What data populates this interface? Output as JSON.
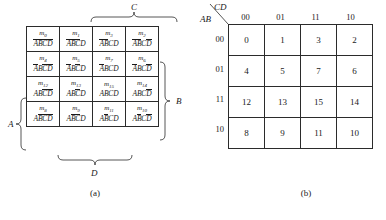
{
  "figure": {
    "caption_a": "(a)",
    "caption_b": "(b)"
  },
  "map_a": {
    "braces": {
      "c_label": "C",
      "b_label": "B",
      "a_label": "A",
      "d_label": "D"
    },
    "rows": [
      [
        {
          "minterm": "m",
          "index": "0",
          "literal_parts": [
            {
              "t": "A",
              "bar": true
            },
            {
              "t": "B",
              "bar": true
            },
            {
              "t": "C",
              "bar": true
            },
            {
              "t": "D",
              "bar": true
            }
          ]
        },
        {
          "minterm": "m",
          "index": "1",
          "literal_parts": [
            {
              "t": "A",
              "bar": true
            },
            {
              "t": "B",
              "bar": true
            },
            {
              "t": "C",
              "bar": true
            },
            {
              "t": "D",
              "bar": false
            }
          ]
        },
        {
          "minterm": "m",
          "index": "3",
          "literal_parts": [
            {
              "t": "A",
              "bar": true
            },
            {
              "t": "B",
              "bar": true
            },
            {
              "t": "C",
              "bar": false
            },
            {
              "t": "D",
              "bar": false
            }
          ]
        },
        {
          "minterm": "m",
          "index": "2",
          "literal_parts": [
            {
              "t": "A",
              "bar": true
            },
            {
              "t": "B",
              "bar": true
            },
            {
              "t": "C",
              "bar": false
            },
            {
              "t": "D",
              "bar": true
            }
          ]
        }
      ],
      [
        {
          "minterm": "m",
          "index": "4",
          "literal_parts": [
            {
              "t": "A",
              "bar": true
            },
            {
              "t": "B",
              "bar": false
            },
            {
              "t": "C",
              "bar": true
            },
            {
              "t": "D",
              "bar": true
            }
          ]
        },
        {
          "minterm": "m",
          "index": "5",
          "literal_parts": [
            {
              "t": "A",
              "bar": true
            },
            {
              "t": "B",
              "bar": false
            },
            {
              "t": "C",
              "bar": true
            },
            {
              "t": "D",
              "bar": false
            }
          ]
        },
        {
          "minterm": "m",
          "index": "7",
          "literal_parts": [
            {
              "t": "A",
              "bar": true
            },
            {
              "t": "B",
              "bar": false
            },
            {
              "t": "C",
              "bar": false
            },
            {
              "t": "D",
              "bar": false
            }
          ]
        },
        {
          "minterm": "m",
          "index": "6",
          "literal_parts": [
            {
              "t": "A",
              "bar": true
            },
            {
              "t": "B",
              "bar": false
            },
            {
              "t": "C",
              "bar": false
            },
            {
              "t": "D",
              "bar": true
            }
          ]
        }
      ],
      [
        {
          "minterm": "m",
          "index": "12",
          "literal_parts": [
            {
              "t": "A",
              "bar": false
            },
            {
              "t": "B",
              "bar": false
            },
            {
              "t": "C",
              "bar": true
            },
            {
              "t": "D",
              "bar": true
            }
          ]
        },
        {
          "minterm": "m",
          "index": "13",
          "literal_parts": [
            {
              "t": "A",
              "bar": false
            },
            {
              "t": "B",
              "bar": false
            },
            {
              "t": "C",
              "bar": true
            },
            {
              "t": "D",
              "bar": false
            }
          ]
        },
        {
          "minterm": "m",
          "index": "15",
          "literal_parts": [
            {
              "t": "A",
              "bar": false
            },
            {
              "t": "B",
              "bar": false
            },
            {
              "t": "C",
              "bar": false
            },
            {
              "t": "D",
              "bar": false
            }
          ]
        },
        {
          "minterm": "m",
          "index": "14",
          "literal_parts": [
            {
              "t": "A",
              "bar": false
            },
            {
              "t": "B",
              "bar": false
            },
            {
              "t": "C",
              "bar": false
            },
            {
              "t": "D",
              "bar": true
            }
          ]
        }
      ],
      [
        {
          "minterm": "m",
          "index": "8",
          "literal_parts": [
            {
              "t": "A",
              "bar": false
            },
            {
              "t": "B",
              "bar": true
            },
            {
              "t": "C",
              "bar": true
            },
            {
              "t": "D",
              "bar": true
            }
          ]
        },
        {
          "minterm": "m",
          "index": "9",
          "literal_parts": [
            {
              "t": "A",
              "bar": false
            },
            {
              "t": "B",
              "bar": true
            },
            {
              "t": "C",
              "bar": true
            },
            {
              "t": "D",
              "bar": false
            }
          ]
        },
        {
          "minterm": "m",
          "index": "11",
          "literal_parts": [
            {
              "t": "A",
              "bar": false
            },
            {
              "t": "B",
              "bar": true
            },
            {
              "t": "C",
              "bar": false
            },
            {
              "t": "D",
              "bar": false
            }
          ]
        },
        {
          "minterm": "m",
          "index": "10",
          "literal_parts": [
            {
              "t": "A",
              "bar": false
            },
            {
              "t": "B",
              "bar": true
            },
            {
              "t": "C",
              "bar": false
            },
            {
              "t": "D",
              "bar": true
            }
          ]
        }
      ]
    ]
  },
  "map_b": {
    "corner_top_label": "CD",
    "corner_bottom_label": "AB",
    "col_headers": [
      "00",
      "01",
      "11",
      "10"
    ],
    "row_headers": [
      "00",
      "01",
      "11",
      "10"
    ],
    "cells": [
      [
        "0",
        "1",
        "3",
        "2"
      ],
      [
        "4",
        "5",
        "7",
        "6"
      ],
      [
        "12",
        "13",
        "15",
        "14"
      ],
      [
        "8",
        "9",
        "11",
        "10"
      ]
    ]
  }
}
